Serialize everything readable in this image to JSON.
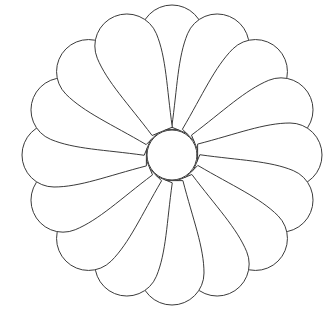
{
  "figure": {
    "background_color": "#ffffff",
    "stroke_color": "#3a3a3a",
    "fill_color": "#ffffff",
    "stroke_width": 1
  },
  "chart_data": {
    "type": "pie",
    "subtitle": "",
    "xlabel": "",
    "ylabel": "",
    "legend_position": "none",
    "grid": false,
    "categories": [
      "petal-01",
      "petal-02",
      "petal-03",
      "petal-04",
      "petal-05",
      "petal-06",
      "petal-07",
      "petal-08",
      "petal-09",
      "petal-10",
      "petal-11",
      "petal-12",
      "petal-13",
      "petal-14",
      "petal-15",
      "petal-16"
    ],
    "values": [
      22.5,
      22.5,
      22.5,
      22.5,
      22.5,
      22.5,
      22.5,
      22.5,
      22.5,
      22.5,
      22.5,
      22.5,
      22.5,
      22.5,
      22.5,
      22.5
    ],
    "annotations": [
      "16 petals, equal angular spacing of 22.5 degrees",
      "first petal points straight up (-90 degrees)",
      "petals also align with the horizontal axis (left and right)"
    ]
  },
  "geometry": {
    "canvas_width": 335,
    "canvas_height": 316,
    "center_x": 172,
    "center_y": 155,
    "petal_count": 16,
    "angle_step_deg": 22.5,
    "start_angle_deg": -90,
    "outer_radius": 150,
    "tip_radius": 32,
    "base_radius": 26,
    "base_half_width": 11,
    "center_disc_radius": 25
  },
  "labels": {
    "center_disc": "center-disc",
    "petal": "petal",
    "emblem": "chrysanthemum-emblem"
  }
}
